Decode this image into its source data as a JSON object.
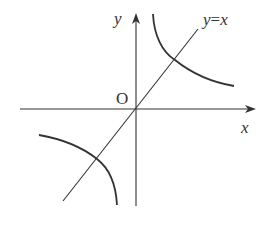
{
  "diagram": {
    "type": "graph of inverse proportion function and line",
    "labels": {
      "y_axis": "y",
      "x_axis": "x",
      "origin": "O",
      "line": "y=x"
    },
    "line_label_parts": {
      "lhs": "y",
      "eq": "=",
      "rhs": "x"
    },
    "elements": [
      {
        "name": "x-axis",
        "kind": "axis with arrow"
      },
      {
        "name": "y-axis",
        "kind": "axis with arrow"
      },
      {
        "name": "line y=x",
        "kind": "straight line through origin"
      },
      {
        "name": "hyperbola branch (first quadrant)",
        "kind": "curve"
      },
      {
        "name": "hyperbola branch (third quadrant)",
        "kind": "curve"
      }
    ],
    "colors": {
      "stroke": "#333333",
      "background": "#ffffff"
    }
  }
}
